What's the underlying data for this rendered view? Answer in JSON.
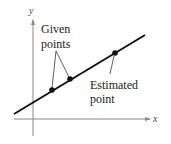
{
  "diagram": {
    "axes": {
      "x_label": "x",
      "y_label": "y",
      "axis_color": "#888888"
    },
    "line_color": "#111111",
    "labels": {
      "given_line1": "Given",
      "given_line2": "points",
      "estimated_line1": "Estimated",
      "estimated_line2": "point"
    },
    "points": [
      {
        "name": "given-point-1",
        "cx": 52,
        "cy": 90
      },
      {
        "name": "given-point-2",
        "cx": 70,
        "cy": 79
      },
      {
        "name": "estimated-point",
        "cx": 115,
        "cy": 53
      }
    ]
  }
}
